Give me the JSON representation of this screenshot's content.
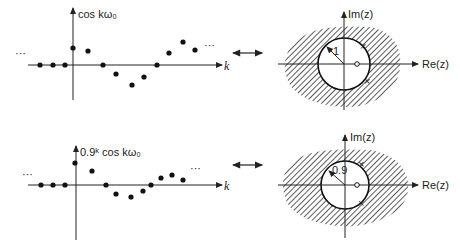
{
  "panels": [
    {
      "id": "top",
      "sequence": {
        "ylabel": "cos kω₀",
        "xlabel": "k",
        "ellipsis": "···",
        "samples": [
          {
            "k": -3,
            "value": 0
          },
          {
            "k": -2,
            "value": 0
          },
          {
            "k": -1,
            "value": 0
          },
          {
            "k": 0,
            "value": 1.0
          },
          {
            "k": 1,
            "value": 0.8
          },
          {
            "k": 2,
            "value": 0
          },
          {
            "k": 3,
            "value": -0.5
          },
          {
            "k": 4,
            "value": -1.1
          },
          {
            "k": 5,
            "value": -0.7
          },
          {
            "k": 6,
            "value": 0
          },
          {
            "k": 7,
            "value": 0.7
          },
          {
            "k": 8,
            "value": 1.3
          },
          {
            "k": 9,
            "value": 0.8
          }
        ]
      },
      "zplane": {
        "re_label": "Re(z)",
        "im_label": "Im(z)",
        "radius_label": "1",
        "zero": "o at z on real axis",
        "roc": "outside circle |z| > 1"
      }
    },
    {
      "id": "bottom",
      "sequence": {
        "ylabel": "0.9ᵏ cos kω₀",
        "xlabel": "k",
        "ellipsis": "···",
        "samples": [
          {
            "k": -3,
            "value": 0
          },
          {
            "k": -2,
            "value": 0
          },
          {
            "k": -1,
            "value": 0
          },
          {
            "k": 0,
            "value": 1.2
          },
          {
            "k": 1,
            "value": 0.8
          },
          {
            "k": 2,
            "value": 0
          },
          {
            "k": 3,
            "value": -0.5
          },
          {
            "k": 4,
            "value": -0.65
          },
          {
            "k": 5,
            "value": -0.35
          },
          {
            "k": 6,
            "value": 0
          },
          {
            "k": 7,
            "value": 0.4
          },
          {
            "k": 8,
            "value": 0.55
          },
          {
            "k": 9,
            "value": 0.3
          }
        ]
      },
      "zplane": {
        "re_label": "Re(z)",
        "im_label": "Im(z)",
        "radius_label": "0.9",
        "zero": "o at z on real axis",
        "roc": "outside circle |z| > 0.9"
      }
    }
  ],
  "correspondence_symbol": "↔"
}
